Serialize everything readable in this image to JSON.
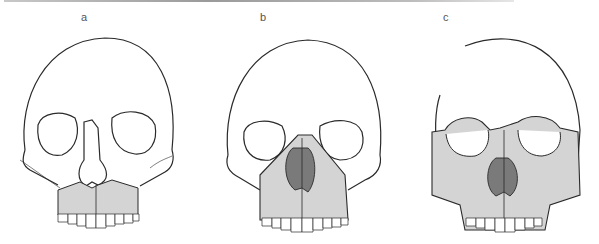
{
  "figure": {
    "panels": [
      {
        "label": "a",
        "fracture": "low",
        "shade_color": "#d4d4d4"
      },
      {
        "label": "b",
        "fracture": "pyramidal",
        "shade_color": "#d4d4d4"
      },
      {
        "label": "c",
        "fracture": "high",
        "shade_color": "#d4d4d4"
      }
    ],
    "line_color": "#2a2a2a"
  }
}
